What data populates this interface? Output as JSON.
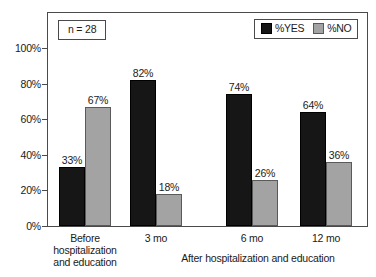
{
  "chart_data": {
    "type": "bar",
    "title": "",
    "subtitle": "",
    "xlabel": "After hospitalization and education",
    "ylabel": "",
    "ylim": [
      0,
      100
    ],
    "y_unit": "%",
    "grid": false,
    "legend_position": "top-right",
    "annotation": "n = 28",
    "categories": [
      "Before\nhospitalization\nand education",
      "3 mo",
      "6 mo",
      "12 mo"
    ],
    "y_ticks": [
      "0%",
      "20%",
      "40%",
      "60%",
      "80%",
      "100%"
    ],
    "y_tick_values": [
      0,
      20,
      40,
      60,
      80,
      100
    ],
    "series": [
      {
        "name": "%YES",
        "color": "#161616",
        "values": [
          33,
          82,
          74,
          64
        ],
        "value_labels": [
          "33%",
          "82%",
          "74%",
          "64%"
        ]
      },
      {
        "name": "%NO",
        "color": "#a3a3a3",
        "values": [
          67,
          18,
          26,
          36
        ],
        "value_labels": [
          "67%",
          "18%",
          "26%",
          "36%"
        ]
      }
    ]
  }
}
